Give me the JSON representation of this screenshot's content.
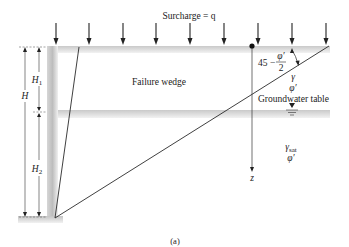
{
  "figure": {
    "caption": "(a)",
    "surcharge_label": "Surcharge = q",
    "failure_wedge_label": "Failure wedge",
    "groundwater_label": "Groundwater table",
    "angle_label": {
      "prefix": "45 −",
      "numerator": "φ′",
      "denominator": "2"
    },
    "upper_soil": {
      "unit_weight": "γ",
      "friction_angle": "φ′"
    },
    "lower_soil": {
      "unit_weight": "γ",
      "unit_weight_sub": "sat",
      "friction_angle": "φ′"
    },
    "depth_axis_label": "z",
    "dimensions": {
      "total_height": "H",
      "upper_height": "H",
      "upper_height_sub": "1",
      "lower_height": "H",
      "lower_height_sub": "2"
    },
    "surcharge_arrow_count": 9,
    "colors": {
      "line": "#2a2a2a",
      "band": "#cfcfcf",
      "wall": "#c4c4c4",
      "text": "#222222"
    }
  }
}
